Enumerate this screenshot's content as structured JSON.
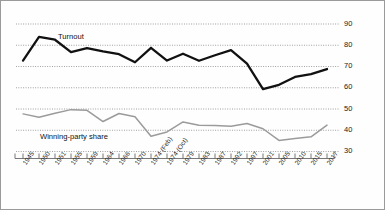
{
  "chart_data": {
    "type": "line",
    "title": "",
    "xlabel": "",
    "ylabel": "",
    "ylim": [
      30,
      90
    ],
    "yticks": [
      30,
      40,
      50,
      60,
      70,
      80,
      90
    ],
    "grid": true,
    "legend_position": "inline-annotation",
    "categories": [
      "1945",
      "1950",
      "1951",
      "1955",
      "1959",
      "1964",
      "1966",
      "1970",
      "1974 (Feb)",
      "1974 (Oct)",
      "1979",
      "1983",
      "1987",
      "1992",
      "1997",
      "2001",
      "2005",
      "2010",
      "2015",
      "2017"
    ],
    "series": [
      {
        "name": "Turnout",
        "color": "#111111",
        "values": [
          72.8,
          83.9,
          82.6,
          76.8,
          78.7,
          77.1,
          75.8,
          72.0,
          78.8,
          72.8,
          76.0,
          72.7,
          75.3,
          77.7,
          71.4,
          59.4,
          61.4,
          65.1,
          66.4,
          68.8
        ]
      },
      {
        "name": "Winning-party share",
        "color": "#9b9b9b",
        "values": [
          47.7,
          46.1,
          48.0,
          49.7,
          49.4,
          44.1,
          47.9,
          46.4,
          37.2,
          39.2,
          43.9,
          42.4,
          42.2,
          41.9,
          43.2,
          40.7,
          35.2,
          36.1,
          36.9,
          42.4
        ]
      }
    ],
    "annotations": [
      {
        "text": "Turnout",
        "near_category": "1951"
      },
      {
        "text": "Winning-party share",
        "near_category": "1955"
      }
    ]
  }
}
